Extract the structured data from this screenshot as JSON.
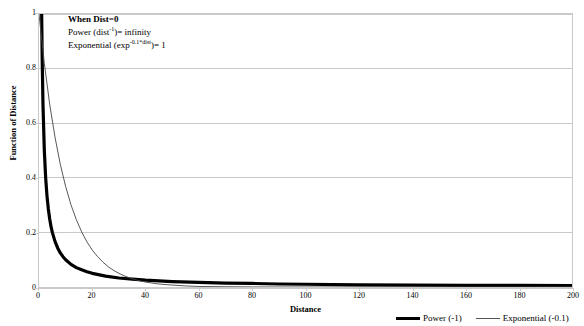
{
  "chart_data": {
    "type": "line",
    "title": "",
    "xlabel": "Distance",
    "ylabel": "Function of Distance",
    "xlim": [
      0,
      200
    ],
    "ylim": [
      0,
      1
    ],
    "grid": "horizontal",
    "legend_position": "bottom-right",
    "xticks": [
      0,
      20,
      40,
      60,
      80,
      100,
      120,
      140,
      160,
      180,
      200
    ],
    "xtick_labels": [
      "0",
      "20",
      "40",
      "60",
      "80",
      "100",
      "120",
      "140",
      "160",
      "180",
      "200"
    ],
    "yticks": [
      0,
      0.2,
      0.4,
      0.6,
      0.8,
      1
    ],
    "ytick_labels": [
      "0",
      "0.2",
      "0.4",
      "0.6",
      "0.8",
      "1"
    ],
    "series": [
      {
        "name": "Power (-1)",
        "formula": "dist^-1",
        "style": "thick-black",
        "x": [
          1,
          1.2,
          1.5,
          2,
          2.5,
          3,
          3.5,
          4,
          4.5,
          5,
          6,
          7,
          8,
          9,
          10,
          12,
          14,
          16,
          18,
          20,
          25,
          30,
          35,
          40,
          50,
          60,
          70,
          80,
          90,
          100,
          120,
          140,
          160,
          180,
          200
        ],
        "y": [
          1,
          0.833,
          0.667,
          0.5,
          0.4,
          0.333,
          0.286,
          0.25,
          0.222,
          0.2,
          0.167,
          0.143,
          0.125,
          0.111,
          0.1,
          0.083,
          0.071,
          0.063,
          0.056,
          0.05,
          0.04,
          0.033,
          0.029,
          0.025,
          0.02,
          0.017,
          0.014,
          0.013,
          0.011,
          0.01,
          0.008,
          0.007,
          0.006,
          0.006,
          0.005
        ]
      },
      {
        "name": "Exponential (-0.1)",
        "formula": "exp^(-0.1*dist)",
        "style": "thin-black",
        "x": [
          0,
          2,
          4,
          6,
          8,
          10,
          12,
          14,
          16,
          18,
          20,
          22,
          24,
          26,
          28,
          30,
          32,
          34,
          36,
          38,
          40,
          45,
          50,
          55,
          60,
          70,
          80,
          90,
          100,
          120,
          140,
          160,
          180,
          200
        ],
        "y": [
          1,
          0.819,
          0.67,
          0.549,
          0.449,
          0.368,
          0.301,
          0.247,
          0.202,
          0.165,
          0.135,
          0.111,
          0.091,
          0.074,
          0.061,
          0.05,
          0.041,
          0.033,
          0.027,
          0.022,
          0.018,
          0.011,
          0.007,
          0.004,
          0.002,
          0.001,
          0.0003,
          0.0001,
          5e-05,
          0,
          0,
          0,
          0,
          0
        ]
      }
    ],
    "annotation": {
      "title": "When Dist=0",
      "line_power_prefix": "Power (dist",
      "line_power_sup": "-1",
      "line_power_suffix": ")= infinity",
      "line_exp_prefix": "Exponential (exp",
      "line_exp_sup": "-0.1*dist",
      "line_exp_suffix": ")= 1"
    }
  },
  "legend": {
    "entries": [
      {
        "label": "Power (-1)"
      },
      {
        "label": "Exponential (-0.1)"
      }
    ]
  },
  "colors": {
    "power_line": "#000000",
    "exponential_line": "#444444",
    "gridline": "#c9c9c9",
    "axis": "#000000",
    "plot_border": "#c9c9c9",
    "background": "#ffffff"
  }
}
